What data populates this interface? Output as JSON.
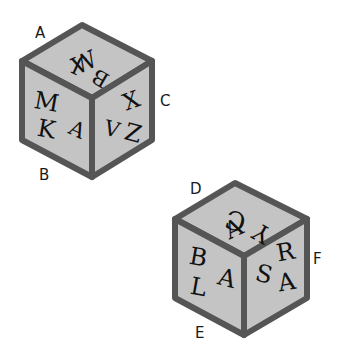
{
  "colors": {
    "face": "#c4c4c4",
    "edge": "#555555",
    "label": "#1a1a1a",
    "letter": "#111111"
  },
  "cubes": [
    {
      "id": "cube-1",
      "vertex_labels": {
        "top_left": "A",
        "bottom_left": "B",
        "right": "C"
      },
      "faces": {
        "top": [
          "J",
          "B",
          "W"
        ],
        "left": [
          "M",
          "K",
          "A"
        ],
        "right": [
          "V",
          "X",
          "Z"
        ]
      }
    },
    {
      "id": "cube-2",
      "vertex_labels": {
        "top_left": "D",
        "bottom_left": "E",
        "right": "F"
      },
      "faces": {
        "top": [
          "C",
          "Y",
          "A"
        ],
        "left": [
          "B",
          "L",
          "A"
        ],
        "right": [
          "R",
          "S",
          "A"
        ]
      }
    }
  ]
}
